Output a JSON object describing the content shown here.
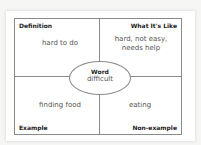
{
  "diagram": {
    "type": "Frayer model",
    "quadrants": {
      "definition": {
        "label": "Definition",
        "text": "hard to do"
      },
      "characteristics": {
        "label": "What It's Like",
        "line1": "hard, not easy,",
        "line2": "needs help"
      },
      "example": {
        "label": "Example",
        "text": "finding food"
      },
      "non_example": {
        "label": "Non-example",
        "text": "eating"
      }
    },
    "center": {
      "label": "Word",
      "value": "difficult"
    }
  }
}
